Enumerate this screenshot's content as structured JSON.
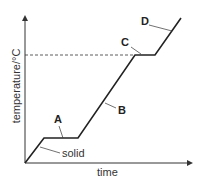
{
  "diagram": {
    "x_axis_label": "time",
    "y_axis_label": "temperature/°C",
    "labels": {
      "A": "A",
      "B": "B",
      "C": "C",
      "D": "D",
      "solid": "solid"
    }
  }
}
